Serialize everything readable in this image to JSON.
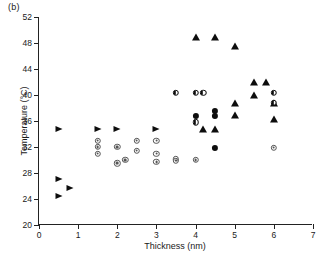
{
  "panel_label": "(b)",
  "chart_data": {
    "type": "scatter",
    "title": "",
    "panel": "(b)",
    "xlabel": "Thickness (nm)",
    "ylabel": "Temperature (°C)",
    "xlim": [
      0,
      7
    ],
    "ylim": [
      20,
      52
    ],
    "xticks": [
      0,
      1,
      2,
      3,
      4,
      5,
      6,
      7
    ],
    "yticks": [
      20,
      24,
      28,
      32,
      36,
      40,
      44,
      48,
      52
    ],
    "xtick_labels": [
      "0",
      "1",
      "2",
      "3",
      "4",
      "5",
      "6",
      "7"
    ],
    "ytick_labels": [
      "20",
      "24",
      "28",
      "32",
      "36",
      "40",
      "44",
      "48",
      "52"
    ],
    "grid": false,
    "legend": "none",
    "series": [
      {
        "name": "triangle-right",
        "marker": "triangle-right",
        "color": "#0d0d0d",
        "points": [
          [
            0.5,
            34.8
          ],
          [
            0.5,
            27.1
          ],
          [
            0.5,
            24.4
          ],
          [
            0.8,
            25.7
          ],
          [
            1.5,
            34.8
          ],
          [
            2.0,
            34.8
          ],
          [
            3.0,
            34.8
          ]
        ]
      },
      {
        "name": "triangle-up",
        "marker": "triangle-up",
        "color": "#0d0d0d",
        "points": [
          [
            4.0,
            49.0
          ],
          [
            4.5,
            49.0
          ],
          [
            5.0,
            47.5
          ],
          [
            4.2,
            34.7
          ],
          [
            4.5,
            34.7
          ],
          [
            5.0,
            38.8
          ],
          [
            5.0,
            37.0
          ],
          [
            5.5,
            42.0
          ],
          [
            5.5,
            40.0
          ],
          [
            5.8,
            42.0
          ],
          [
            6.0,
            38.8
          ],
          [
            6.0,
            36.3
          ]
        ]
      },
      {
        "name": "circle-half",
        "marker": "circle-half",
        "color": "#0d0d0d",
        "points": [
          [
            3.5,
            40.3
          ],
          [
            4.0,
            40.3
          ],
          [
            4.2,
            40.3
          ],
          [
            4.0,
            35.8
          ],
          [
            6.0,
            40.3
          ],
          [
            6.0,
            38.8
          ]
        ]
      },
      {
        "name": "circle-filled",
        "marker": "circle-filled",
        "color": "#0d0d0d",
        "points": [
          [
            4.0,
            36.8
          ],
          [
            4.5,
            37.5
          ],
          [
            4.5,
            36.8
          ],
          [
            4.5,
            31.9
          ]
        ]
      },
      {
        "name": "circle-dot",
        "marker": "circle-dot",
        "color": "#555555",
        "points": [
          [
            1.5,
            33.0
          ],
          [
            1.5,
            32.0
          ],
          [
            1.5,
            31.0
          ],
          [
            2.0,
            32.0
          ],
          [
            2.0,
            29.5
          ],
          [
            2.2,
            30.0
          ],
          [
            2.5,
            33.0
          ],
          [
            2.5,
            31.4
          ],
          [
            3.0,
            33.0
          ],
          [
            3.0,
            31.0
          ],
          [
            3.0,
            29.7
          ],
          [
            3.5,
            30.1
          ],
          [
            3.5,
            29.9
          ],
          [
            4.0,
            30.0
          ],
          [
            6.0,
            31.9
          ]
        ]
      }
    ]
  }
}
